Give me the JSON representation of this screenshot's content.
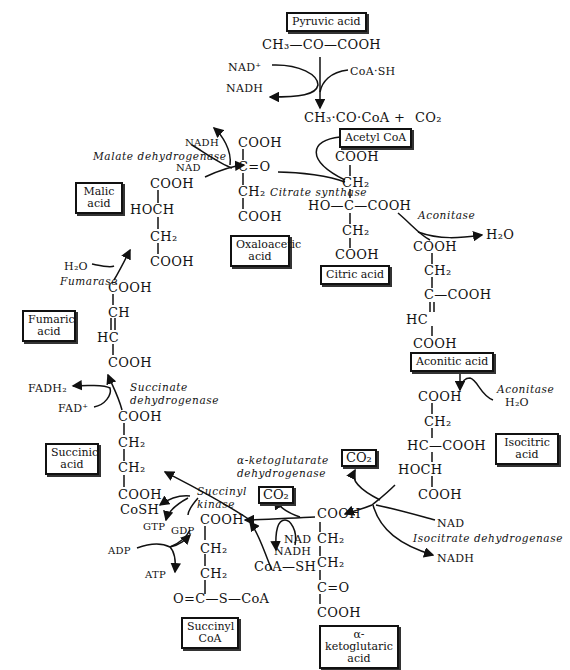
{
  "compounds": {
    "pyruvic": {
      "label": "Pyruvic acid",
      "formula": "CH₃—CO—COOH"
    },
    "acetyl": {
      "label": "Acetyl CoA",
      "formula": "CH₃·CO·CoA +",
      "co2": "CO₂"
    },
    "citric": {
      "label": "Citric acid",
      "lines": [
        "COOH",
        "CH₂",
        "HO—C—COOH",
        "CH₂",
        "COOH"
      ]
    },
    "aconitic": {
      "label": "Aconitic acid",
      "lines": [
        "COOH",
        "CH₂",
        "C—COOH",
        "HC",
        "COOH"
      ]
    },
    "isocitric": {
      "label": "Isocitric acid",
      "lines": [
        "COOH",
        "CH₂",
        "HC—COOH",
        "HOCH",
        "COOH"
      ]
    },
    "ketoglutaric": {
      "label": "α-ketoglutaric acid",
      "lines": [
        "COOH",
        "CH₂",
        "CH₂",
        "C=O",
        "COOH"
      ]
    },
    "succinylcoa": {
      "label": "Succinyl CoA",
      "lines": [
        "COOH",
        "CH₂",
        "CH₂",
        "O=C—S—CoA"
      ]
    },
    "succinic": {
      "label": "Succinic acid",
      "lines": [
        "COOH",
        "CH₂",
        "CH₂",
        "COOH"
      ]
    },
    "fumaric": {
      "label": "Fumaric acid",
      "lines": [
        "COOH",
        "CH",
        "HC",
        "COOH"
      ]
    },
    "malic": {
      "label": "Malic acid",
      "lines": [
        "COOH",
        "HOCH",
        "CH₂",
        "COOH"
      ]
    },
    "oxaloacetic": {
      "label": "Oxaloacetic acid",
      "lines": [
        "COOH",
        "C=O",
        "CH₂",
        "COOH"
      ]
    }
  },
  "enzymes": {
    "citrate_synthase": "Citrate synthase",
    "aconitase1": "Aconitase",
    "aconitase2": "Aconitase",
    "isocitrate_dh": "Isocitrate dehydrogenase",
    "akg_dh_1": "α-ketoglutarate",
    "akg_dh_2": "dehydrogenase",
    "succinyl_kinase_1": "Succinyl",
    "succinyl_kinase_2": "kinase",
    "succinate_dh_1": "Succinate",
    "succinate_dh_2": "dehydrogenase",
    "fumarase": "Fumarase",
    "malate_dh": "Malate dehydrogenase"
  },
  "cofactors": {
    "nad_plus": "NAD⁺",
    "nadh_top": "NADH",
    "coash_top": "CoA·SH",
    "h2o_acon": "H₂O",
    "h2o_acon2": "H₂O",
    "co2_iso": "CO₂",
    "nad_iso": "NAD",
    "nadh_iso": "NADH",
    "co2_akg": "CO₂",
    "nad_akg": "NAD",
    "nadh_akg": "NADH",
    "coash_akg": "CoA—SH",
    "cosh": "CoSH",
    "gtp": "GTP",
    "gdp": "GDP",
    "adp": "ADP",
    "atp": "ATP",
    "fadh2": "FADH₂",
    "fad": "FAD⁺",
    "h2o_fum": "H₂O",
    "nadh_mal": "NADH",
    "nad_mal": "NAD"
  }
}
